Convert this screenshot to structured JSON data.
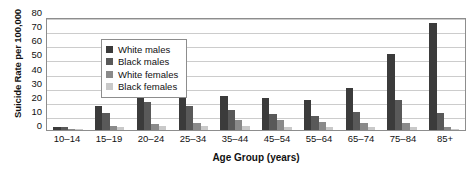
{
  "chart_data": {
    "type": "bar",
    "title": "",
    "xlabel": "Age Group (years)",
    "ylabel": "Suicide Rate per 100,000",
    "ylim": [
      0,
      80
    ],
    "ytick_step": 10,
    "yticks": [
      80,
      70,
      60,
      50,
      40,
      30,
      20,
      10,
      0
    ],
    "grid": true,
    "legend_position": "top-left inside plot",
    "categories": [
      "10–14",
      "15–19",
      "20–24",
      "25–34",
      "35–44",
      "45–54",
      "55–64",
      "65–74",
      "75–84",
      "85+"
    ],
    "series": [
      {
        "name": "White males",
        "color": "#3b3b3b",
        "values": [
          2,
          17,
          24,
          24,
          24,
          23,
          21,
          30,
          54,
          76
        ]
      },
      {
        "name": "Black males",
        "color": "#595959",
        "values": [
          2,
          12,
          20,
          17,
          14,
          11,
          10,
          13,
          21,
          12
        ]
      },
      {
        "name": "White females",
        "color": "#8a8a8a",
        "values": [
          1,
          3,
          4,
          5,
          7,
          7,
          6,
          5,
          5,
          2
        ]
      },
      {
        "name": "Black females",
        "color": "#c9c9c9",
        "values": [
          1,
          2,
          3,
          3,
          3,
          2,
          2,
          2,
          2,
          1
        ]
      }
    ]
  },
  "legend": {
    "items": [
      {
        "label": "White males"
      },
      {
        "label": "Black males"
      },
      {
        "label": "White females"
      },
      {
        "label": "Black females"
      }
    ]
  },
  "colors": {
    "axis": "#8d8d8d",
    "gridline": "#cccccc",
    "text": "#111111",
    "background": "#ffffff"
  }
}
